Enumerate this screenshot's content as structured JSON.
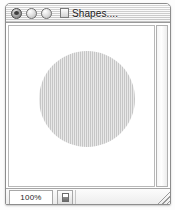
{
  "window": {
    "title": "Shapes....",
    "doc_icon": "document-icon",
    "controls": [
      {
        "name": "close-button",
        "label": "Close",
        "state": "active"
      },
      {
        "name": "minimize-button",
        "label": "Minimize",
        "state": "inactive"
      },
      {
        "name": "zoom-button",
        "label": "Zoom",
        "state": "inactive"
      }
    ]
  },
  "canvas": {
    "shapes": [
      {
        "type": "circle",
        "name": "gray-circle",
        "fill": "#cdcdcd",
        "diameter_px": 96
      }
    ],
    "background": "#ffffff"
  },
  "scrollbars": {
    "vertical": {
      "name": "vertical-scrollbar",
      "position": 0
    }
  },
  "statusbar": {
    "zoom_level": "100%",
    "zoom_placeholder": "100%",
    "page_button_icon": "page-icon",
    "resize_grip": "resize-grip"
  },
  "colors": {
    "window_border": "#8d8d8d",
    "titlebar_top": "#f2f2f2",
    "titlebar_bottom": "#cfcfcf",
    "shape_fill": "#cdcdcd",
    "canvas_bg": "#ffffff"
  }
}
